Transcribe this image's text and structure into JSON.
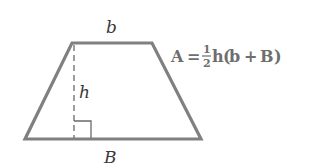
{
  "diagram": {
    "shape": "trapezoid",
    "stroke_color": "#808080",
    "label_color": "#3a3a3a",
    "formula_color": "#6e6e6e",
    "vertices": {
      "top_left": [
        72,
        43
      ],
      "top_right": [
        152,
        43
      ],
      "bottom_right": [
        201,
        139
      ],
      "bottom_left": [
        25,
        139
      ]
    },
    "labels": {
      "top_base": "b",
      "height": "h",
      "bottom_base": "B"
    },
    "formula": {
      "lhs": "A",
      "equals": "=",
      "fraction_numerator": "1",
      "fraction_denominator": "2",
      "h": "h",
      "open_paren": "(",
      "b": "b",
      "plus": "+",
      "B": "B",
      "close_paren": ")",
      "full_text": "A = 1/2 h(b + B)"
    }
  }
}
